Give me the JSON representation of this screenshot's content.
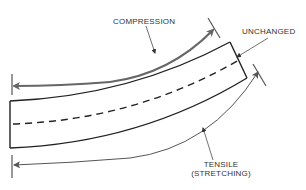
{
  "diagram": {
    "labels": {
      "compression": "COMPRESSION",
      "unchanged": "UNCHANGED",
      "tensile_line1": "TENSILE",
      "tensile_line2": "(STRETCHING)"
    },
    "colors": {
      "beam_outline": "#222222",
      "compression_arrow": "#666666",
      "tensile_arrow": "#555555",
      "text": "#333333"
    }
  }
}
